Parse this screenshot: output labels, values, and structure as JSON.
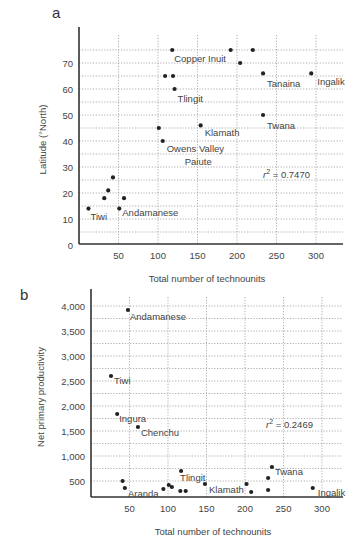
{
  "chart_data": [
    {
      "panel": "a",
      "type": "scatter",
      "title": "",
      "xlabel": "Total number of technounits",
      "ylabel": "Latitude (°North)",
      "xlim": [
        0,
        330
      ],
      "ylim": [
        0,
        80
      ],
      "xticks": [
        50,
        100,
        150,
        200,
        250,
        300
      ],
      "yticks": [
        0,
        10,
        20,
        30,
        40,
        50,
        60,
        70
      ],
      "grid": true,
      "annotation": "= 0.7470",
      "annotation_prefix": "r",
      "annotation_sup": "2",
      "points": [
        {
          "x": 12,
          "y": 14,
          "label": "Tiwi"
        },
        {
          "x": 51,
          "y": 14,
          "label": "Andamanese"
        },
        {
          "x": 32,
          "y": 18,
          "label": ""
        },
        {
          "x": 57,
          "y": 18,
          "label": ""
        },
        {
          "x": 37,
          "y": 21,
          "label": ""
        },
        {
          "x": 43,
          "y": 26,
          "label": ""
        },
        {
          "x": 101,
          "y": 45,
          "label": ""
        },
        {
          "x": 106,
          "y": 40,
          "label": "Owens Valley\nPaiute"
        },
        {
          "x": 154,
          "y": 46,
          "label": "Klamath"
        },
        {
          "x": 121,
          "y": 60,
          "label": "Tlingit"
        },
        {
          "x": 109,
          "y": 65,
          "label": ""
        },
        {
          "x": 119,
          "y": 65,
          "label": ""
        },
        {
          "x": 118,
          "y": 75,
          "label": "Copper Inuit"
        },
        {
          "x": 192,
          "y": 75,
          "label": ""
        },
        {
          "x": 220,
          "y": 75,
          "label": ""
        },
        {
          "x": 204,
          "y": 70,
          "label": ""
        },
        {
          "x": 233,
          "y": 66,
          "label": "Tanaina"
        },
        {
          "x": 294,
          "y": 66,
          "label": "Ingalik"
        },
        {
          "x": 233,
          "y": 50,
          "label": "Twana"
        }
      ]
    },
    {
      "panel": "b",
      "type": "scatter",
      "title": "",
      "xlabel": "Total number of technounits",
      "ylabel": "Net primary productivity",
      "xlim": [
        0,
        330
      ],
      "ylim": [
        180,
        4100
      ],
      "xticks": [
        50,
        100,
        150,
        200,
        250,
        300
      ],
      "yticks": [
        500,
        1000,
        1500,
        2000,
        2500,
        3000,
        3500,
        4000
      ],
      "ytick_labels": [
        "500",
        "1,000",
        "1,500",
        "2,000",
        "2,500",
        "3,000",
        "3,500",
        "4,000"
      ],
      "grid": true,
      "annotation": "= 0.2469",
      "annotation_prefix": "r",
      "annotation_sup": "2",
      "points": [
        {
          "x": 48,
          "y": 3920,
          "label": "Andamanese"
        },
        {
          "x": 26,
          "y": 2600,
          "label": "Tiwi"
        },
        {
          "x": 34,
          "y": 1840,
          "label": "Ingura"
        },
        {
          "x": 61,
          "y": 1580,
          "label": "Chenchu"
        },
        {
          "x": 41,
          "y": 500,
          "label": ""
        },
        {
          "x": 44,
          "y": 360,
          "label": "Aranda"
        },
        {
          "x": 94,
          "y": 340,
          "label": ""
        },
        {
          "x": 101,
          "y": 420,
          "label": ""
        },
        {
          "x": 105,
          "y": 380,
          "label": ""
        },
        {
          "x": 117,
          "y": 700,
          "label": "Tlingit"
        },
        {
          "x": 116,
          "y": 300,
          "label": ""
        },
        {
          "x": 123,
          "y": 300,
          "label": ""
        },
        {
          "x": 148,
          "y": 440,
          "label": "Klamath"
        },
        {
          "x": 202,
          "y": 440,
          "label": ""
        },
        {
          "x": 208,
          "y": 280,
          "label": ""
        },
        {
          "x": 230,
          "y": 560,
          "label": ""
        },
        {
          "x": 235,
          "y": 780,
          "label": "Twana"
        },
        {
          "x": 230,
          "y": 320,
          "label": ""
        },
        {
          "x": 288,
          "y": 360,
          "label": "Ingalik"
        }
      ]
    }
  ]
}
